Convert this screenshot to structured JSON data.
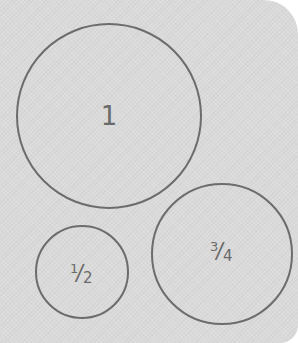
{
  "diagram": {
    "background_color": "#dadada",
    "stroke_color": "#6c6c6c",
    "text_color": "#6a6a6a",
    "circles": [
      {
        "id": "circle-one",
        "label": "1",
        "value": 1,
        "center": [
          109,
          116
        ],
        "radius": 93
      },
      {
        "id": "circle-half",
        "label": "1/2",
        "numerator": "1",
        "slash": "/",
        "denominator": "2",
        "value": 0.5,
        "center": [
          82,
          272
        ],
        "radius": 47
      },
      {
        "id": "circle-three-quarters",
        "label": "3/4",
        "numerator": "3",
        "slash": "/",
        "denominator": "4",
        "value": 0.75,
        "center": [
          222,
          254
        ],
        "radius": 71
      }
    ]
  }
}
